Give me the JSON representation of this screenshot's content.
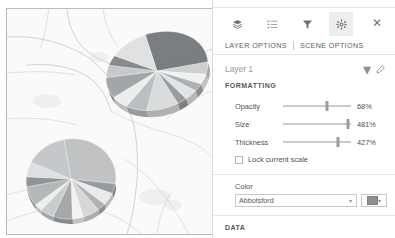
{
  "toolbar": {
    "icons": [
      {
        "name": "layers-icon",
        "label": "Layers",
        "active": false
      },
      {
        "name": "legend-icon",
        "label": "Legend",
        "active": false
      },
      {
        "name": "filter-icon",
        "label": "Filter",
        "active": false
      },
      {
        "name": "settings-icon",
        "label": "Settings",
        "active": true
      }
    ],
    "close_label": "✕"
  },
  "tabs": {
    "layer_options": "LAYER OPTIONS",
    "scene_options": "SCENE OPTIONS",
    "active": "LAYER OPTIONS"
  },
  "layer": {
    "name": "Layer 1",
    "caret": "▾",
    "edit_icon": "pencil-icon"
  },
  "sections": {
    "formatting": "FORMATTING",
    "data": "DATA"
  },
  "sliders": [
    {
      "label": "Opacity",
      "value": "68%",
      "percent": 64
    },
    {
      "label": "Size",
      "value": "481%",
      "percent": 95
    },
    {
      "label": "Thickness",
      "value": "427%",
      "percent": 81
    }
  ],
  "lock_scale": {
    "label": "Lock current scale",
    "checked": false
  },
  "color": {
    "label": "Color",
    "selected": "Abbotsford",
    "swatch_hex": "#8d9093",
    "caret": "▾"
  },
  "map": {
    "background_hex": "#fafafa",
    "road_hex": "#cfd2d4",
    "border_hex": "#b9bcbe",
    "charts": [
      {
        "name": "pie-chart-north",
        "cx": 150,
        "cy": 62,
        "rx": 52,
        "ry": 38,
        "rotate": -18,
        "depth": 7,
        "slices": [
          {
            "value": 28,
            "hex": "#6e7174"
          },
          {
            "value": 5,
            "hex": "#c9cbcd"
          },
          {
            "value": 4,
            "hex": "#f0f1f1"
          },
          {
            "value": 3,
            "hex": "#a5a8ab"
          },
          {
            "value": 4,
            "hex": "#e0e1e2"
          },
          {
            "value": 3,
            "hex": "#8f9295"
          },
          {
            "value": 10,
            "hex": "#d6d8d9"
          },
          {
            "value": 7,
            "hex": "#b6b9bb"
          },
          {
            "value": 6,
            "hex": "#ebecec"
          },
          {
            "value": 9,
            "hex": "#9a9da0"
          },
          {
            "value": 5,
            "hex": "#c2c4c6"
          },
          {
            "value": 4,
            "hex": "#7d8083"
          },
          {
            "value": 12,
            "hex": "#dddfe0"
          }
        ]
      },
      {
        "name": "pie-chart-south",
        "cx": 64,
        "cy": 170,
        "rx": 45,
        "ry": 40,
        "rotate": -10,
        "depth": 5,
        "slices": [
          {
            "value": 30,
            "hex": "#babdbf"
          },
          {
            "value": 4,
            "hex": "#8e9194"
          },
          {
            "value": 5,
            "hex": "#e8e9ea"
          },
          {
            "value": 3,
            "hex": "#a8abad"
          },
          {
            "value": 6,
            "hex": "#d2d4d5"
          },
          {
            "value": 4,
            "hex": "#f2f2f2"
          },
          {
            "value": 7,
            "hex": "#9ea1a4"
          },
          {
            "value": 5,
            "hex": "#c6c8ca"
          },
          {
            "value": 3,
            "hex": "#eceded"
          },
          {
            "value": 8,
            "hex": "#aeb1b3"
          },
          {
            "value": 4,
            "hex": "#868a8d"
          },
          {
            "value": 6,
            "hex": "#dcdddf"
          },
          {
            "value": 15,
            "hex": "#c0c3c5"
          }
        ]
      }
    ],
    "roads": [
      "M 0 28 C 30 26, 55 34, 74 44 C 92 54, 106 72, 118 92 C 128 110, 132 140, 130 170 C 128 196, 124 212, 120 225",
      "M 60 0 C 62 18, 68 32, 80 42 C 94 54, 112 58, 132 58 C 156 58, 180 50, 205 40",
      "M 20 56 C 44 54, 64 58, 78 66 C 92 74, 100 88, 104 102",
      "M 0 64 C 26 62, 48 62, 68 66",
      "M 96 0 C 98 14, 102 26, 110 36",
      "M 0 110 C 24 108, 48 110, 70 116",
      "M 0 186 C 20 180, 40 176, 56 178",
      "M 104 102 C 118 110, 138 118, 160 124 C 180 130, 196 138, 205 148",
      "M 118 150 C 136 162, 152 178, 164 196 C 172 208, 178 218, 182 225",
      "M 0 212 C 26 202, 50 196, 72 198 C 96 200, 118 210, 134 225",
      "M 42 0 C 40 12, 38 26, 34 38",
      "M 205 82 C 188 88, 172 98, 160 110",
      "M 150 225 C 152 210, 156 196, 164 184"
    ]
  }
}
